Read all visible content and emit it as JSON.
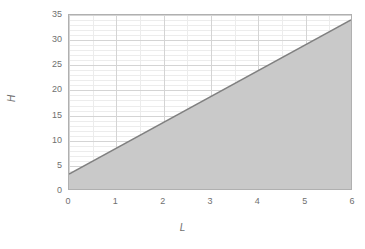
{
  "chart_data": {
    "type": "area",
    "title": "",
    "subtitle": "",
    "xlabel": "L",
    "ylabel": "H",
    "xlim": [
      0,
      6
    ],
    "ylim": [
      0,
      35
    ],
    "x_ticks": [
      "0",
      "1",
      "2",
      "3",
      "4",
      "5",
      "6"
    ],
    "y_ticks": [
      "0",
      "5",
      "10",
      "15",
      "20",
      "25",
      "30",
      "35"
    ],
    "x_tick_values": [
      0,
      1,
      2,
      3,
      4,
      5,
      6
    ],
    "y_tick_values": [
      0,
      5,
      10,
      15,
      20,
      25,
      30,
      35
    ],
    "x_minor_step": 0.5,
    "y_minor_step": 1,
    "grid": true,
    "legend": "none",
    "series": [
      {
        "name": "boundary-line",
        "type": "line",
        "x": [
          0,
          6
        ],
        "values": [
          3,
          34
        ],
        "intercept": 3,
        "slope": 5.1667,
        "color": "#808080"
      },
      {
        "name": "shaded-region",
        "type": "area",
        "description": "region below the line",
        "x": [
          0,
          6
        ],
        "values": [
          3,
          34
        ],
        "baseline": 0,
        "color": "#c9c9c9"
      }
    ],
    "annotations": []
  },
  "axis": {
    "y_title": "H",
    "x_title": "L"
  },
  "colors": {
    "line": "#808080",
    "fill": "#c9c9c9",
    "frame": "#b0b0b0",
    "grid_major": "#d4d4d4",
    "grid_minor": "#ececec",
    "tick_text": "#6f6f6f",
    "background": "#ffffff"
  }
}
